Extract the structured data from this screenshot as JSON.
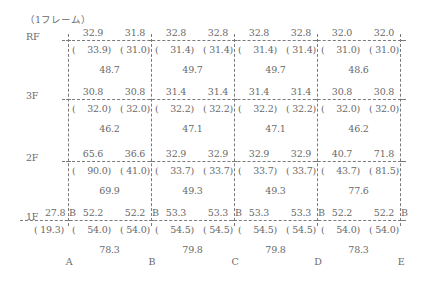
{
  "title": "（1フレーム）",
  "floors": [
    "RF",
    "3F",
    "2F",
    "1F"
  ],
  "axes": [
    "A",
    "B",
    "C",
    "D",
    "E"
  ],
  "support_label": "B",
  "colors": {
    "line": "#7a7a7a",
    "text": "#6a6a6a"
  },
  "rows": [
    {
      "floor": "RF",
      "bays": [
        {
          "top_left": "32.9",
          "top_right": "31.8",
          "paren_left": "33.9",
          "paren_right": "31.0",
          "center": "48.7"
        },
        {
          "top_left": "32.8",
          "top_right": "32.8",
          "paren_left": "31.4",
          "paren_right": "31.4",
          "center": "49.7"
        },
        {
          "top_left": "32.8",
          "top_right": "32.8",
          "paren_left": "31.4",
          "paren_right": "31.4",
          "center": "49.7"
        },
        {
          "top_left": "32.0",
          "top_right": "32.0",
          "paren_left": "31.0",
          "paren_right": "31.0",
          "center": "48.6"
        }
      ]
    },
    {
      "floor": "3F",
      "bays": [
        {
          "top_left": "30.8",
          "top_right": "30.8",
          "paren_left": "32.0",
          "paren_right": "32.0",
          "center": "46.2"
        },
        {
          "top_left": "31.4",
          "top_right": "31.4",
          "paren_left": "32.2",
          "paren_right": "32.2",
          "center": "47.1"
        },
        {
          "top_left": "31.4",
          "top_right": "31.4",
          "paren_left": "32.2",
          "paren_right": "32.2",
          "center": "47.1"
        },
        {
          "top_left": "30.8",
          "top_right": "30.8",
          "paren_left": "32.0",
          "paren_right": "32.0",
          "center": "46.2"
        }
      ]
    },
    {
      "floor": "2F",
      "bays": [
        {
          "top_left": "65.6",
          "top_right": "36.6",
          "paren_left": "90.0",
          "paren_right": "41.0",
          "center": "69.9"
        },
        {
          "top_left": "32.9",
          "top_right": "32.9",
          "paren_left": "33.7",
          "paren_right": "33.7",
          "center": "49.3"
        },
        {
          "top_left": "32.9",
          "top_right": "32.9",
          "paren_left": "33.7",
          "paren_right": "33.7",
          "center": "49.3"
        },
        {
          "top_left": "40.7",
          "top_right": "71.8",
          "paren_left": "43.7",
          "paren_right": "81.5",
          "center": "77.6"
        }
      ]
    },
    {
      "floor": "1F",
      "cantilever": {
        "top": "27.8",
        "paren": "19.3"
      },
      "bays": [
        {
          "top_left": "52.2",
          "top_right": "52.2",
          "paren_left": "54.0",
          "paren_right": "54.0",
          "center": "78.3"
        },
        {
          "top_left": "53.3",
          "top_right": "53.3",
          "paren_left": "54.5",
          "paren_right": "54.5",
          "center": "79.8"
        },
        {
          "top_left": "53.3",
          "top_right": "53.3",
          "paren_left": "54.5",
          "paren_right": "54.5",
          "center": "79.8"
        },
        {
          "top_left": "52.2",
          "top_right": "52.2",
          "paren_left": "54.0",
          "paren_right": "54.0",
          "center": "78.3"
        }
      ]
    }
  ]
}
